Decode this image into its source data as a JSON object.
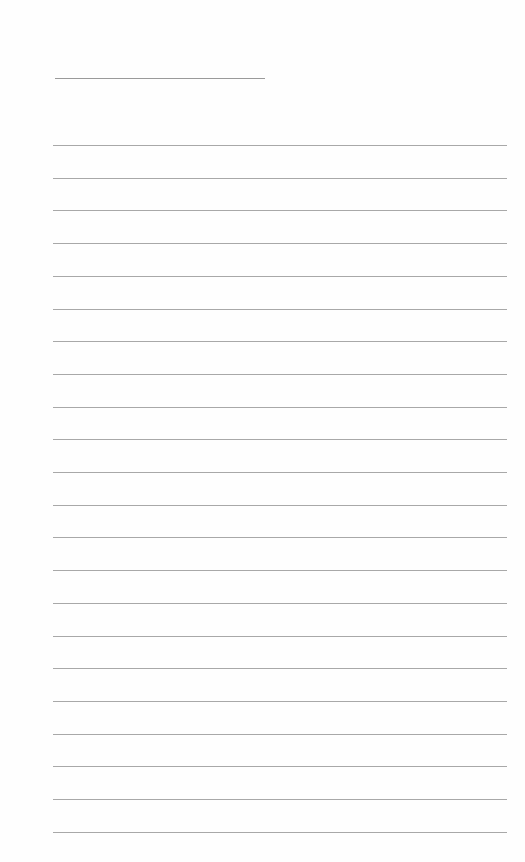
{
  "page": {
    "type": "lined-notepad",
    "background_color": "#fefefe",
    "line_color": "#a8a8a8",
    "title_line": {
      "present": true,
      "text": ""
    },
    "ruled_line_count": 22,
    "lines_text": [
      "",
      "",
      "",
      "",
      "",
      "",
      "",
      "",
      "",
      "",
      "",
      "",
      "",
      "",
      "",
      "",
      "",
      "",
      "",
      "",
      "",
      ""
    ]
  }
}
